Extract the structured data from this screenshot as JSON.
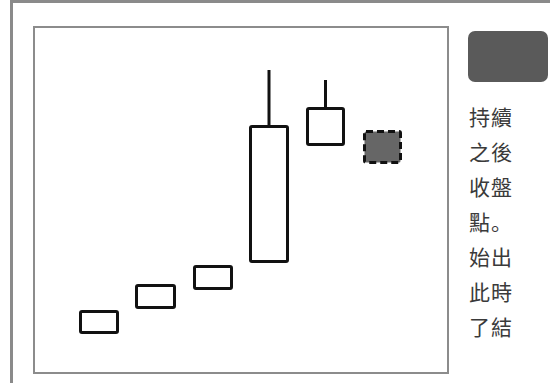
{
  "chart_data": {
    "type": "candlestick",
    "title": "",
    "xlabel": "",
    "ylabel": "",
    "grid": false,
    "legend": false,
    "candles": [
      {
        "index": 1,
        "style": "hollow",
        "body_left": 79,
        "body_right": 119,
        "body_top": 310,
        "body_bottom": 334,
        "wick_top": null
      },
      {
        "index": 2,
        "style": "hollow",
        "body_left": 135,
        "body_right": 176,
        "body_top": 284,
        "body_bottom": 309,
        "wick_top": null
      },
      {
        "index": 3,
        "style": "hollow",
        "body_left": 193,
        "body_right": 233,
        "body_top": 265,
        "body_bottom": 290,
        "wick_top": null
      },
      {
        "index": 4,
        "style": "hollow",
        "body_left": 249,
        "body_right": 289,
        "body_top": 125,
        "body_bottom": 263,
        "wick_top": 70
      },
      {
        "index": 5,
        "style": "hollow",
        "body_left": 306,
        "body_right": 345,
        "body_top": 107,
        "body_bottom": 146,
        "wick_top": 80
      },
      {
        "index": 6,
        "style": "dashed-filled",
        "body_left": 363,
        "body_right": 402,
        "body_top": 130,
        "body_bottom": 164,
        "wick_top": null
      }
    ],
    "colors": {
      "outline": "#111111",
      "hollow_fill": "#ffffff",
      "dashed_fill": "#666666"
    }
  },
  "side": {
    "text_lines": [
      "持續",
      "之後",
      "收盤",
      "點。",
      "始出",
      "此時",
      "了結"
    ]
  }
}
